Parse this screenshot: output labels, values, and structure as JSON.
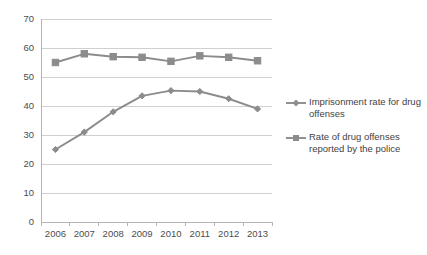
{
  "chart_data": {
    "type": "line",
    "title": "",
    "subtitle": "",
    "xlabel": "",
    "ylabel": "",
    "categories": [
      "2006",
      "2007",
      "2008",
      "2009",
      "2010",
      "2011",
      "2012",
      "2013"
    ],
    "series": [
      {
        "name": "Imprisonment rate for drug offenses",
        "marker": "diamond",
        "color": "#8c8c8c",
        "values": [
          25,
          31,
          38,
          43.5,
          45.3,
          45,
          42.5,
          39
        ]
      },
      {
        "name": "Rate of drug offenses reported by the police",
        "marker": "square",
        "color": "#8c8c8c",
        "values": [
          55,
          58,
          57,
          56.8,
          55.4,
          57.3,
          56.8,
          55.6
        ]
      }
    ],
    "ylim": [
      0,
      70
    ],
    "yticks": [
      0,
      10,
      20,
      30,
      40,
      50,
      60,
      70
    ],
    "ytick_labels": [
      "0",
      "10",
      "20",
      "30",
      "40",
      "50",
      "60",
      "70"
    ],
    "grid": true,
    "grid_axis": "y",
    "legend_position": "right",
    "legend": [
      {
        "label_lines": [
          "Imprisonment rate for drug",
          "offenses"
        ],
        "marker": "diamond-line-key"
      },
      {
        "label_lines": [
          "Rate of drug offenses",
          "reported by the police"
        ],
        "marker": "square-line-key"
      }
    ],
    "colors": {
      "series": "#8c8c8c",
      "gridline": "#d0d0d0",
      "axis": "#b5b5b5",
      "text": "#4d4d4d",
      "background": "#ffffff"
    }
  }
}
